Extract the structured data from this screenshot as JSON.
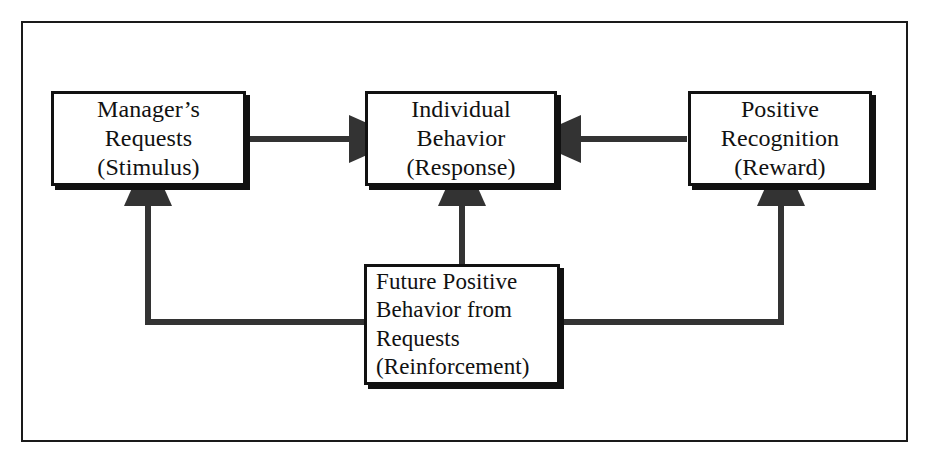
{
  "diagram": {
    "line_color": "#333333",
    "box_border_color": "#111111",
    "background_color": "#ffffff",
    "frame_color": "#1a1a1a",
    "nodes": {
      "stimulus": {
        "id": "stimulus",
        "lines": [
          "Manager’s",
          "Requests",
          "(Stimulus)"
        ],
        "align": "center"
      },
      "response": {
        "id": "response",
        "lines": [
          "Individual",
          "Behavior",
          "(Response)"
        ],
        "align": "center"
      },
      "reward": {
        "id": "reward",
        "lines": [
          "Positive",
          "Recognition",
          "(Reward)"
        ],
        "align": "center"
      },
      "reinforcement": {
        "id": "reinforcement",
        "lines": [
          "Future Positive",
          "Behavior from",
          "Requests",
          "(Reinforcement)"
        ],
        "align": "left"
      }
    },
    "connections": [
      {
        "id": "stimulus-to-response",
        "from": "stimulus",
        "to": "response",
        "direction": "right",
        "arrowhead": true
      },
      {
        "id": "reward-to-response",
        "from": "reward",
        "to": "response",
        "direction": "left",
        "arrowhead": true
      },
      {
        "id": "reinforcement-to-response",
        "from": "reinforcement",
        "to": "response",
        "direction": "up",
        "arrowhead": true
      },
      {
        "id": "reinforcement-to-stimulus",
        "from": "reinforcement",
        "to": "stimulus",
        "direction": "up",
        "arrowhead": true
      },
      {
        "id": "reinforcement-to-reward",
        "from": "reinforcement",
        "to": "reward",
        "direction": "up",
        "arrowhead": true
      }
    ]
  }
}
